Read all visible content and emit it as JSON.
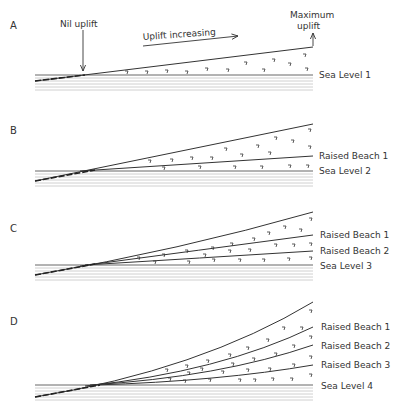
{
  "panels": [
    {
      "id": "A",
      "letter": "A",
      "annotations": {
        "nil_uplift": "Nil uplift",
        "uplift_increasing": "Uplift increasing",
        "maximum_uplift_line1": "Maximum",
        "maximum_uplift_line2": "uplift"
      },
      "labels": [
        "Sea Level 1"
      ]
    },
    {
      "id": "B",
      "letter": "B",
      "labels": [
        "Raised Beach 1",
        "Sea Level 2"
      ]
    },
    {
      "id": "C",
      "letter": "C",
      "labels": [
        "Raised Beach 1",
        "Raised Beach 2",
        "Sea Level 3"
      ]
    },
    {
      "id": "D",
      "letter": "D",
      "labels": [
        "Raised Beach 1",
        "Raised Beach 2",
        "Raised Beach 3",
        "Sea Level 4"
      ]
    }
  ],
  "colors": {
    "line": "#333333",
    "hatch": "#bbbbbb",
    "text": "#333333"
  }
}
